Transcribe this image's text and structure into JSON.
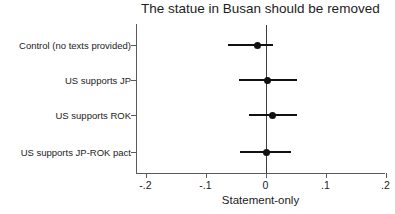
{
  "chart_data": {
    "type": "scatter",
    "title": "The statue in Busan should be removed",
    "xlabel": "Statement-only",
    "ylabel": "",
    "orientation": "horizontal",
    "grid": false,
    "legend": null,
    "xlim": [
      -0.2,
      0.2
    ],
    "xticks": [
      -0.2,
      -0.1,
      0,
      0.1,
      0.2
    ],
    "xtick_labels": [
      "-.2",
      "-.1",
      "0",
      ".1",
      ".2"
    ],
    "reference_line": 0,
    "categories": [
      "Control (no texts provided)",
      "US supports JP",
      "US supports ROK",
      "US supports JP-ROK pact"
    ],
    "values": [
      -0.013,
      0.003,
      0.012,
      0.002
    ],
    "ci_low": [
      -0.062,
      -0.045,
      -0.028,
      -0.042
    ],
    "ci_high": [
      0.012,
      0.053,
      0.053,
      0.042
    ],
    "series": [
      {
        "name": "Statement-only",
        "points": [
          {
            "category": "Control (no texts provided)",
            "estimate": -0.013,
            "ci_low": -0.062,
            "ci_high": 0.012
          },
          {
            "category": "US supports JP",
            "estimate": 0.003,
            "ci_low": -0.045,
            "ci_high": 0.053
          },
          {
            "category": "US supports ROK",
            "estimate": 0.012,
            "ci_low": -0.028,
            "ci_high": 0.053
          },
          {
            "category": "US supports JP-ROK pact",
            "estimate": 0.002,
            "ci_low": -0.042,
            "ci_high": 0.042
          }
        ]
      }
    ]
  },
  "axis": {
    "x_title": "Statement-only",
    "tick_0": "-.2",
    "tick_1": "-.1",
    "tick_2": "0",
    "tick_3": ".1",
    "tick_4": ".2"
  },
  "labels": {
    "cat_0": "Control (no texts provided)",
    "cat_1": "US supports JP",
    "cat_2": "US supports ROK",
    "cat_3": "US supports JP-ROK pact"
  },
  "title": "The statue in Busan should be removed",
  "colors": {
    "point": "#111111",
    "axis": "#5a5a5a",
    "reference": "#3c3c3c",
    "text": "#1c1c1c",
    "background": "#ffffff"
  }
}
